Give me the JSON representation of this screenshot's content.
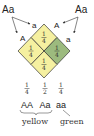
{
  "parents": {
    "left": "Aa",
    "right": "Aa"
  },
  "gametes": {
    "left_top": "a",
    "left_bottom": "A",
    "right_top": "A",
    "right_bottom": "a"
  },
  "cells": {
    "top": {
      "num": "1",
      "den": "4",
      "color": "#f5f0a0"
    },
    "left": {
      "num": "1",
      "den": "4",
      "color": "#f5f0a0"
    },
    "right": {
      "num": "1",
      "den": "4",
      "color": "#9cba7e"
    },
    "bottom": {
      "num": "1",
      "den": "4",
      "color": "#f5f0a0"
    }
  },
  "ratios": [
    {
      "num": "1",
      "den": "4"
    },
    {
      "num": "1",
      "den": "2"
    },
    {
      "num": "1",
      "den": "4"
    }
  ],
  "genotypes": [
    "AA",
    "Aa",
    "aa"
  ],
  "phenotypes": {
    "yellow": "yellow",
    "green": "green"
  }
}
